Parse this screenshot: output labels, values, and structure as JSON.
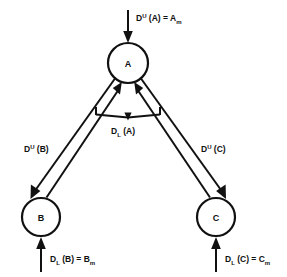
{
  "diagram": {
    "background_color": "#ffffff",
    "stroke_color": "#111111",
    "nodes": [
      {
        "id": "A",
        "label": "A",
        "cx": 128,
        "cy": 63,
        "r": 20
      },
      {
        "id": "B",
        "label": "B",
        "cx": 41,
        "cy": 217,
        "r": 19
      },
      {
        "id": "C",
        "label": "C",
        "cx": 216,
        "cy": 217,
        "r": 19
      }
    ],
    "labels": {
      "top_input": {
        "base": "D",
        "sup": "U",
        "mid": " (A) = A",
        "sub": "m",
        "x": 136,
        "y": 18
      },
      "left_edge": {
        "base": "D",
        "sup": "U",
        "mid": " (B)",
        "sub": "",
        "x": 24,
        "y": 150
      },
      "right_edge": {
        "base": "D",
        "sup": "U",
        "mid": " (C)",
        "sub": "",
        "x": 201,
        "y": 150
      },
      "center": {
        "base": "D",
        "sup": "",
        "mid": " (A)",
        "sub": "L",
        "x": 112,
        "y": 134
      },
      "bottom_left": {
        "base": "D",
        "sup": "",
        "mid": " (B) = B",
        "sub": "L",
        "sub2": "m",
        "x": 45,
        "y": 259
      },
      "bottom_right": {
        "base": "D",
        "sup": "",
        "mid": " (C) = C",
        "sub": "L",
        "sub2": "m",
        "x": 215,
        "y": 259
      }
    },
    "arrows": {
      "top_input_arrow": {
        "from_y": 10,
        "to_y": 42,
        "x": 128,
        "direction": "down"
      },
      "bottom_left_arrow": {
        "from_y": 272,
        "to_y": 238,
        "x": 41,
        "direction": "up"
      },
      "bottom_right_arrow": {
        "from_y": 272,
        "to_y": 238,
        "x": 216,
        "direction": "up"
      }
    },
    "edges": [
      {
        "id": "A-to-B",
        "from": "A",
        "to": "B",
        "direction": "down-left",
        "label_ref": "left_edge"
      },
      {
        "id": "B-to-A",
        "from": "B",
        "to": "A",
        "direction": "up-right",
        "label_ref": "left_edge"
      },
      {
        "id": "A-to-C",
        "from": "A",
        "to": "C",
        "direction": "down-right",
        "label_ref": "right_edge"
      },
      {
        "id": "C-to-A",
        "from": "C",
        "to": "A",
        "direction": "up-left",
        "label_ref": "right_edge"
      },
      {
        "id": "center-bracket",
        "from": "bracket-left",
        "to": "bracket-right",
        "direction": "down-notch",
        "label_ref": "center"
      }
    ]
  }
}
